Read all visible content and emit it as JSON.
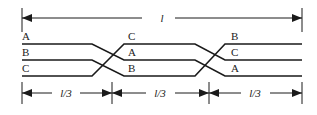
{
  "dimension_total": {
    "label": "l"
  },
  "dimension_segments": [
    {
      "label": "l/3"
    },
    {
      "label": "l/3"
    },
    {
      "label": "l/3"
    }
  ],
  "sections": [
    {
      "labels_top_to_bottom": [
        "A",
        "B",
        "C"
      ]
    },
    {
      "labels_top_to_bottom": [
        "C",
        "A",
        "B"
      ]
    },
    {
      "labels_top_to_bottom": [
        "B",
        "C",
        "A"
      ]
    }
  ],
  "colors": {
    "line": "#1a1a1a",
    "background": "#ffffff"
  }
}
